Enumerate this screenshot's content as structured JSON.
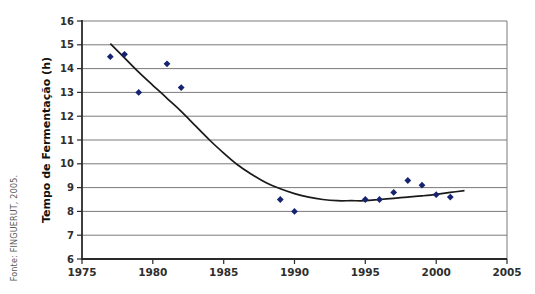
{
  "source": {
    "text": "Fonte: FINGUERUT, 2005."
  },
  "chart_data": {
    "type": "scatter",
    "ylabel": "Tempo de Fermentação (h)",
    "xlim": [
      1975,
      2005
    ],
    "ylim": [
      6,
      16
    ],
    "x_ticks": [
      1975,
      1980,
      1985,
      1990,
      1995,
      2000,
      2005
    ],
    "y_ticks": [
      6,
      7,
      8,
      9,
      10,
      11,
      12,
      13,
      14,
      15,
      16
    ],
    "grid": "horizontal",
    "legend": "none",
    "colors": {
      "marker": "#16246f",
      "trend_line": "#1a1a1a",
      "gridline": "#7a7a7a",
      "axis": "#2a2a2a"
    },
    "series": [
      {
        "id": "observed",
        "type": "scatter",
        "marker": "diamond",
        "points": [
          [
            1977,
            14.5
          ],
          [
            1978,
            14.6
          ],
          [
            1979,
            13.0
          ],
          [
            1981,
            14.2
          ],
          [
            1982,
            13.2
          ],
          [
            1989,
            8.5
          ],
          [
            1990,
            8.0
          ],
          [
            1995,
            8.5
          ],
          [
            1996,
            8.5
          ],
          [
            1997,
            8.8
          ],
          [
            1998,
            9.3
          ],
          [
            1999,
            9.1
          ],
          [
            2000,
            8.7
          ],
          [
            2001,
            8.6
          ]
        ]
      },
      {
        "id": "trend",
        "type": "line",
        "points": [
          [
            1977,
            15.05
          ],
          [
            1978,
            14.45
          ],
          [
            1979,
            13.85
          ],
          [
            1980,
            13.3
          ],
          [
            1981,
            12.75
          ],
          [
            1982,
            12.2
          ],
          [
            1983,
            11.6
          ],
          [
            1984,
            11.0
          ],
          [
            1985,
            10.45
          ],
          [
            1986,
            9.95
          ],
          [
            1987,
            9.55
          ],
          [
            1988,
            9.2
          ],
          [
            1989,
            8.95
          ],
          [
            1990,
            8.75
          ],
          [
            1991,
            8.6
          ],
          [
            1992,
            8.5
          ],
          [
            1993,
            8.45
          ],
          [
            1994,
            8.45
          ],
          [
            1995,
            8.45
          ],
          [
            1996,
            8.5
          ],
          [
            1997,
            8.55
          ],
          [
            1998,
            8.6
          ],
          [
            1999,
            8.65
          ],
          [
            2000,
            8.72
          ],
          [
            2001,
            8.8
          ],
          [
            2002,
            8.87
          ]
        ]
      }
    ]
  }
}
